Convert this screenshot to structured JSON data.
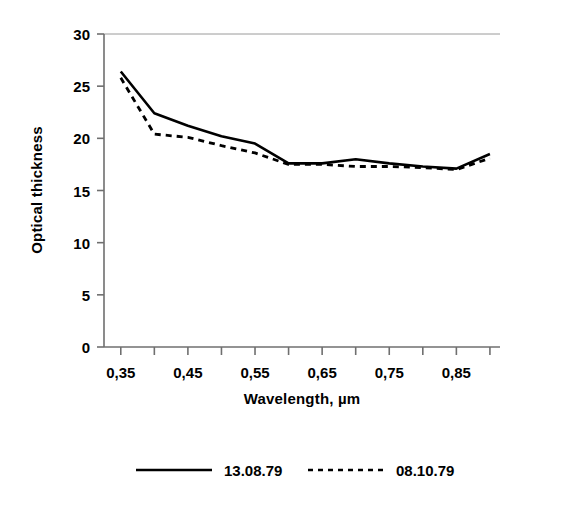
{
  "chart_data": {
    "type": "line",
    "title": "",
    "xlabel": "Wavelength,  µm",
    "ylabel": "Optical thickness",
    "xlim": [
      0.325,
      0.915
    ],
    "ylim": [
      0,
      30
    ],
    "yticks": [
      0,
      5,
      10,
      15,
      20,
      25,
      30
    ],
    "ytick_labels": [
      "0",
      "5",
      "10",
      "15",
      "20",
      "25",
      "30"
    ],
    "xticks": [
      0.35,
      0.4,
      0.45,
      0.5,
      0.55,
      0.6,
      0.65,
      0.7,
      0.75,
      0.8,
      0.85,
      0.9
    ],
    "xtick_labels_shown": [
      "0,35",
      "0,45",
      "0,55",
      "0,65",
      "0,75",
      "0,85"
    ],
    "xtick_labels_shown_values": [
      0.35,
      0.45,
      0.55,
      0.65,
      0.75,
      0.85
    ],
    "grid": false,
    "legend_position": "bottom",
    "x": [
      0.35,
      0.4,
      0.45,
      0.5,
      0.55,
      0.6,
      0.65,
      0.7,
      0.75,
      0.8,
      0.85,
      0.9
    ],
    "series": [
      {
        "name": "13.08.79",
        "style": "solid",
        "color": "#000000",
        "values": [
          26.4,
          22.4,
          21.2,
          20.2,
          19.5,
          17.6,
          17.6,
          18.0,
          17.6,
          17.3,
          17.1,
          18.5
        ]
      },
      {
        "name": "08.10.79",
        "style": "dotted",
        "color": "#000000",
        "values": [
          25.8,
          20.4,
          20.1,
          19.3,
          18.6,
          17.5,
          17.5,
          17.3,
          17.3,
          17.2,
          17.0,
          18.1
        ]
      }
    ]
  },
  "axes": {
    "y_title": "Optical thickness",
    "x_title_main": "Wavelength,",
    "x_title_unit": "µm"
  },
  "legend": {
    "entries": [
      {
        "label": "13.08.79",
        "style": "solid"
      },
      {
        "label": "08.10.79",
        "style": "dotted"
      }
    ]
  }
}
